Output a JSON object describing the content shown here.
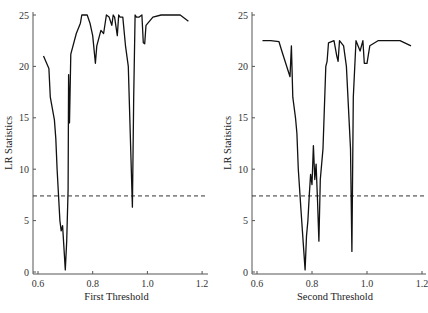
{
  "chart_data": [
    {
      "type": "line",
      "title": "",
      "xlabel": "First Threshold",
      "ylabel": "LR Statistics",
      "xlim": [
        0.585,
        1.21
      ],
      "ylim": [
        0,
        25
      ],
      "xticks": [
        0.6,
        0.8,
        1.0,
        1.2
      ],
      "xtick_labels": [
        "0.6",
        "0.8",
        "1.0",
        "1.2"
      ],
      "yticks": [
        0,
        5,
        10,
        15,
        20,
        25
      ],
      "ytick_labels": [
        "0",
        "5",
        "10",
        "15",
        "20",
        "25"
      ],
      "grid": false,
      "critical_value_line": 7.4,
      "series": [
        {
          "name": "LR statistic",
          "x": [
            0.62,
            0.64,
            0.645,
            0.66,
            0.665,
            0.67,
            0.68,
            0.685,
            0.69,
            0.7,
            0.705,
            0.71,
            0.712,
            0.715,
            0.72,
            0.74,
            0.755,
            0.76,
            0.78,
            0.79,
            0.8,
            0.81,
            0.815,
            0.83,
            0.84,
            0.85,
            0.86,
            0.87,
            0.875,
            0.88,
            0.89,
            0.895,
            0.9,
            0.91,
            0.92,
            0.93,
            0.945,
            0.95,
            0.955,
            0.96,
            0.97,
            0.98,
            0.985,
            0.99,
            0.995,
            1.02,
            1.05,
            1.12,
            1.15
          ],
          "values": [
            21.0,
            19.8,
            17.0,
            14.8,
            13.0,
            10.0,
            5.0,
            4.0,
            4.5,
            0.2,
            3.0,
            8.0,
            19.2,
            14.5,
            21.2,
            23.2,
            24.2,
            25.0,
            25.0,
            24.2,
            23.0,
            20.3,
            22.0,
            23.5,
            23.2,
            25.0,
            24.8,
            24.0,
            25.0,
            24.8,
            23.0,
            25.0,
            24.8,
            24.8,
            22.0,
            20.0,
            6.3,
            17.0,
            25.0,
            24.8,
            24.8,
            25.0,
            22.3,
            22.2,
            24.0,
            24.8,
            25.0,
            25.0,
            24.4
          ]
        }
      ]
    },
    {
      "type": "line",
      "title": "",
      "xlabel": "Second Threshold",
      "ylabel": "LR Statistics",
      "xlim": [
        0.585,
        1.21
      ],
      "ylim": [
        0,
        25
      ],
      "xticks": [
        0.6,
        0.8,
        1.0,
        1.2
      ],
      "xtick_labels": [
        "0.6",
        "0.8",
        "1.0",
        "1.2"
      ],
      "yticks": [
        0,
        5,
        10,
        15,
        20,
        25
      ],
      "ytick_labels": [
        "0",
        "5",
        "10",
        "15",
        "20",
        "25"
      ],
      "grid": false,
      "critical_value_line": 7.4,
      "series": [
        {
          "name": "LR statistic",
          "x": [
            0.62,
            0.65,
            0.68,
            0.69,
            0.72,
            0.725,
            0.73,
            0.74,
            0.745,
            0.75,
            0.76,
            0.765,
            0.775,
            0.78,
            0.785,
            0.79,
            0.795,
            0.8,
            0.805,
            0.81,
            0.815,
            0.82,
            0.825,
            0.83,
            0.84,
            0.85,
            0.855,
            0.86,
            0.88,
            0.89,
            0.895,
            0.9,
            0.915,
            0.925,
            0.94,
            0.945,
            0.95,
            0.96,
            0.975,
            0.985,
            0.99,
            1.0,
            1.01,
            1.04,
            1.12,
            1.16
          ],
          "values": [
            22.5,
            22.5,
            22.4,
            21.5,
            19.0,
            22.0,
            17.0,
            15.0,
            13.5,
            10.0,
            6.0,
            4.0,
            0.2,
            3.5,
            5.0,
            7.5,
            9.5,
            8.5,
            12.3,
            9.0,
            10.5,
            7.0,
            3.0,
            9.0,
            12.0,
            20.0,
            20.5,
            22.3,
            22.5,
            21.0,
            20.5,
            22.5,
            22.0,
            20.0,
            12.0,
            2.0,
            17.0,
            22.5,
            21.5,
            22.5,
            20.3,
            20.3,
            22.0,
            22.5,
            22.5,
            22.0
          ]
        }
      ]
    }
  ],
  "panels": [
    {
      "xlabel": "First Threshold",
      "ylabel": "LR Statistics"
    },
    {
      "xlabel": "Second Threshold",
      "ylabel": "LR Statistics"
    }
  ]
}
